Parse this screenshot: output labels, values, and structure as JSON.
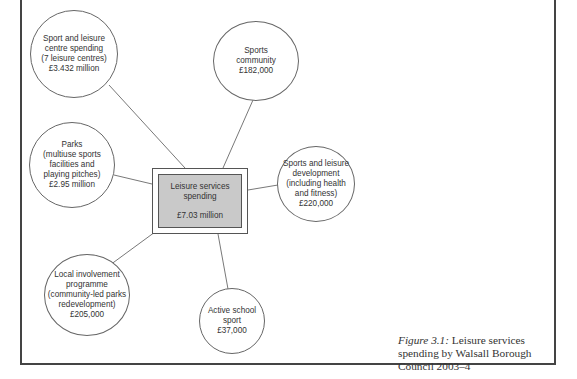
{
  "diagram": {
    "center": {
      "title_line1": "Leisure services",
      "title_line2": "spending",
      "amount": "£7.03 million",
      "fill_color": "#c9c9c9"
    },
    "nodes": [
      {
        "id": "sport-leisure-centre",
        "text": "Sport and leisure\ncentre spending\n(7 leisure centres)\n£3.432 million"
      },
      {
        "id": "sports-community",
        "text": "Sports\ncommunity\n£182,000"
      },
      {
        "id": "parks",
        "text": "Parks\n(multiuse sports\nfacilities and\nplaying pitches)\n£2.95 million"
      },
      {
        "id": "sports-leisure-development",
        "text": "Sports and leisure\ndevelopment\n(including health\nand fitness)\n£220,000"
      },
      {
        "id": "local-involvement",
        "text": "Local involvement\nprogramme\n(community-led parks\nredevelopment)\n£205,000"
      },
      {
        "id": "active-school-sport",
        "text": "Active school\nsport\n£37,000"
      }
    ]
  },
  "caption": {
    "label": "Figure 3.1:",
    "text": " Leisure services spending by Walsall Borough Council 2003–4"
  }
}
